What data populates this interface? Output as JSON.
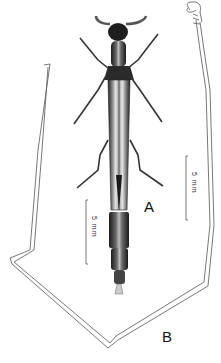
{
  "figure": {
    "panel_labels": {
      "a": "A",
      "b": "B"
    },
    "scale_bars": [
      {
        "label": "5 mm",
        "panel": "A"
      },
      {
        "label": "5 mm",
        "panel": "B"
      }
    ],
    "subjects": {
      "a": "beetle-dorsal-view",
      "b": "elongated-appendage-outline"
    },
    "colors": {
      "ink": "#111111",
      "outline": "#444444",
      "background": "#ffffff"
    }
  }
}
